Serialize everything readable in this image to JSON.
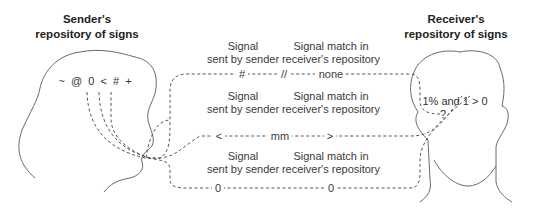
{
  "sender": {
    "title_line1": "Sender's",
    "title_line2": "repository of signs",
    "signs": "~  @  0  <  #  +"
  },
  "receiver": {
    "title_line1": "Receiver's",
    "title_line2": "repository of signs",
    "signs_line1": "1% and 1 > 0",
    "signs_line2": "?"
  },
  "rows": [
    {
      "sent_label_1": "Signal",
      "sent_label_2": "sent by sender",
      "match_label_1": "Signal match in",
      "match_label_2": "receiver's repository",
      "sent_value": "#",
      "mid_marker": "//",
      "match_value": "none"
    },
    {
      "sent_label_1": "Signal",
      "sent_label_2": "sent by sender",
      "match_label_1": "Signal match in",
      "match_label_2": "receiver's repository",
      "sent_value": "<",
      "mid_marker": "mm",
      "match_value": ">"
    },
    {
      "sent_label_1": "Signal",
      "sent_label_2": "sent by sender",
      "match_label_1": "Signal match in",
      "match_label_2": "receiver's repository",
      "sent_value": "0",
      "mid_marker": "",
      "match_value": "0"
    }
  ]
}
